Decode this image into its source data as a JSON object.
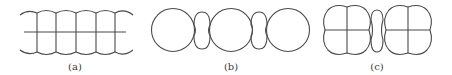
{
  "figures": [
    {
      "id": "a",
      "label": "(a)",
      "description": "Row of cells bounded by scalloped arcs top and bottom, with vertical dividers and a horizontal midline",
      "label_x": 75
    },
    {
      "id": "b",
      "label": "(b)",
      "description": "Three large circles joined by two small pinched peanut-shaped bridges",
      "label_x": 231
    },
    {
      "id": "c",
      "label": "(c)",
      "description": "Two four-lobed clover shapes (quadrant-divided) joined by a small peanut-shaped bridge",
      "label_x": 377
    }
  ],
  "style": {
    "stroke_color": "#4a4a4a",
    "background": "#ffffff"
  }
}
